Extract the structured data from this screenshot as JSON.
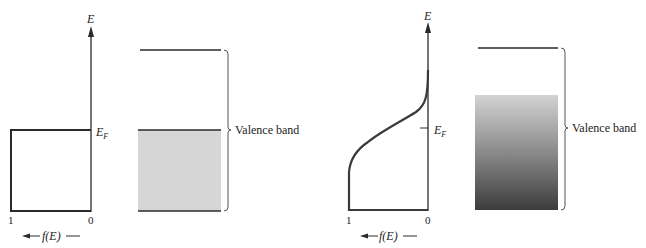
{
  "panels": [
    {
      "id": "left",
      "axis_label": "E",
      "fermi_label": "E",
      "fermi_sub": "F",
      "tick_one": "1",
      "tick_zero": "0",
      "f_label_main": "f(E)",
      "band_label": "Valence band",
      "fill_color": "#d9d9d9",
      "description": "T = 0 K: step distribution, valence band filled up to E_F"
    },
    {
      "id": "right",
      "axis_label": "E",
      "fermi_label": "E",
      "fermi_sub": "F",
      "tick_one": "1",
      "tick_zero": "0",
      "f_label_main": "f(E)",
      "band_label": "Valence band",
      "gradient_top": "#d0d0d0",
      "gradient_bottom": "#404040",
      "description": "T > 0 K: smooth Fermi-Dirac distribution, graded occupancy"
    }
  ],
  "colors": {
    "line": "#2a2a2a",
    "curve": "#3a3a3a",
    "bracket": "#555555"
  }
}
